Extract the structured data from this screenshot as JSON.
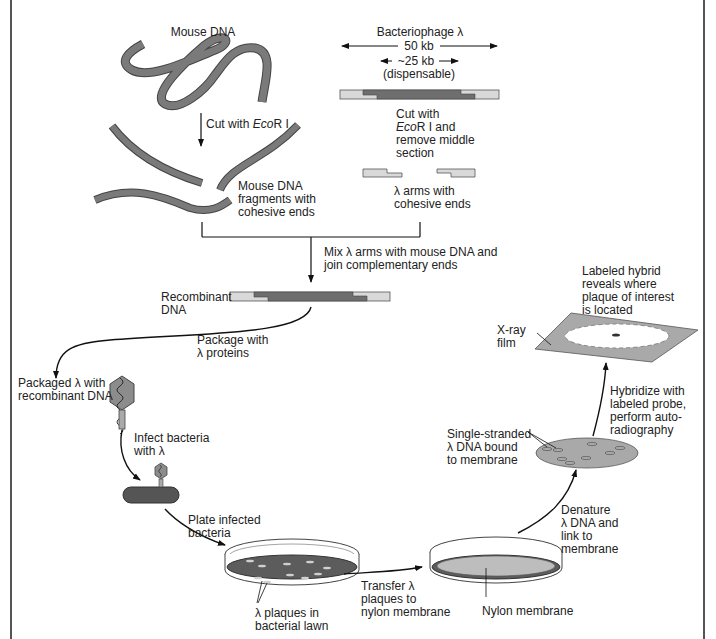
{
  "colors": {
    "dna_dark": "#6e6e6e",
    "dna_light": "#d9d9d9",
    "outline": "#444444",
    "lawn": "#5c5c5c",
    "membrane": "#bdbdbd",
    "film": "#a9a9a9"
  },
  "labels": {
    "mouse_dna": "Mouse DNA",
    "bacteriophage": "Bacteriophage λ",
    "size_50kb": "50 kb",
    "size_25kb": "~25 kb",
    "dispensable": "(dispensable)",
    "cut_ecori_prefix": "Cut with ",
    "cut_ecori_italic": "Eco",
    "cut_ecori_suffix": "R I",
    "cut_remove_line1": "Cut with",
    "cut_remove_italic": "Eco",
    "cut_remove_line2_suffix": "R I and",
    "cut_remove_line3": "remove middle\nsection",
    "mouse_fragments": "Mouse DNA\nfragments with\ncohesive ends",
    "lambda_arms": "λ arms with\ncohesive ends",
    "mix_join": "Mix λ arms with mouse DNA and\njoin complementary ends",
    "recombinant_dna": "Recombinant\nDNA",
    "package_with": "Package with\nλ proteins",
    "packaged_lambda": "Packaged λ with\nrecombinant DNA",
    "infect_bacteria": "Infect bacteria\nwith λ",
    "plate_infected": "Plate infected\nbacteria",
    "plaques_in_lawn": "λ plaques in\nbacterial lawn",
    "transfer_plaques": "Transfer λ\nplaques to\nnylon membrane",
    "nylon_membrane": "Nylon membrane",
    "denature": "Denature\nλ DNA and\nlink to\nmembrane",
    "single_stranded": "Single-stranded\nλ DNA bound\nto membrane",
    "hybridize": "Hybridize with\nlabeled probe,\nperform auto-\nradiography",
    "xray_film": "X-ray\nfilm",
    "labeled_hybrid": "Labeled hybrid\nreveals where\nplaque of interest\nis located"
  }
}
